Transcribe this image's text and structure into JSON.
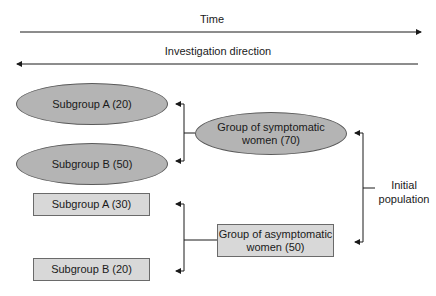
{
  "axes": {
    "time_label": "Time",
    "investigation_label": "Investigation direction"
  },
  "symptomatic": {
    "group_label": "Group of symptomatic women (70)",
    "group_line1": "Group of symptomatic",
    "group_line2": "women (70)",
    "subgroup_a": "Subgroup A (20)",
    "subgroup_b": "Subgroup B (50)"
  },
  "asymptomatic": {
    "group_label": "Group of asymptomatic women (50)",
    "group_line1": "Group of asymptomatic",
    "group_line2": "women (50)",
    "subgroup_a": "Subgroup A (30)",
    "subgroup_b": "Subgroup B (20)"
  },
  "initial_population": {
    "line1": "Initial",
    "line2": "population"
  },
  "colors": {
    "ellipse_fill": "#b4b4b4",
    "rect_fill": "#d8d8d8",
    "line": "#1a1a1a"
  }
}
